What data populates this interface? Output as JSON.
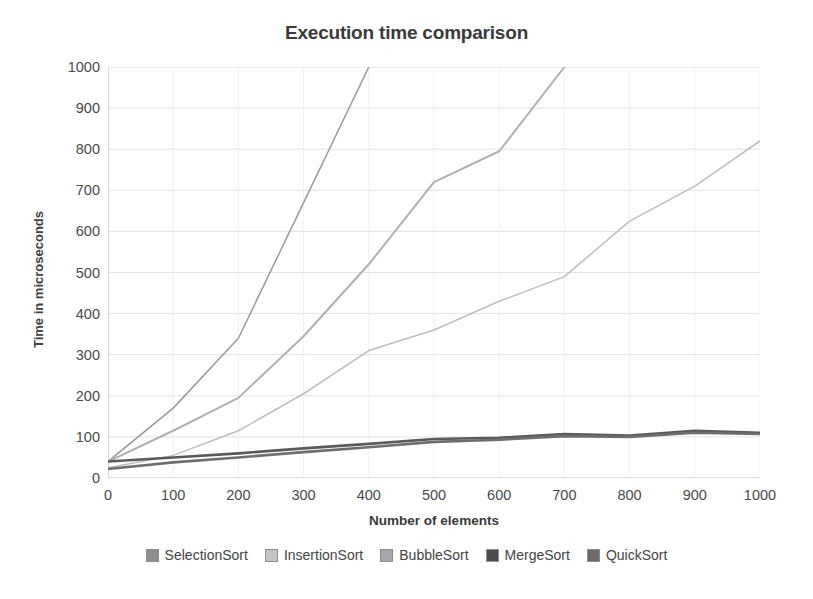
{
  "chart_data": {
    "type": "line",
    "title": "Execution time comparison",
    "xlabel": "Number of elements",
    "ylabel": "Time in microseconds",
    "xlim": [
      0,
      1000
    ],
    "ylim": [
      0,
      1000
    ],
    "xticks": [
      0,
      100,
      200,
      300,
      400,
      500,
      600,
      700,
      800,
      900,
      1000
    ],
    "yticks": [
      0,
      100,
      200,
      300,
      400,
      500,
      600,
      700,
      800,
      900,
      1000
    ],
    "grid": true,
    "grid_axis": "y",
    "legend_position": "bottom",
    "x": [
      0,
      100,
      200,
      300,
      400,
      500,
      600,
      700,
      800,
      900,
      1000
    ],
    "series": [
      {
        "name": "SelectionSort",
        "color": "#9a9a9a",
        "values": [
          40,
          170,
          340,
          670,
          1000,
          null,
          null,
          null,
          null,
          null,
          null
        ],
        "note": "clipped above 1000 after x=400"
      },
      {
        "name": "InsertionSort",
        "color": "#bdbdbd",
        "values": [
          25,
          55,
          115,
          205,
          310,
          360,
          430,
          490,
          625,
          710,
          820
        ]
      },
      {
        "name": "BubbleSort",
        "color": "#b0b0b0",
        "values": [
          40,
          115,
          195,
          345,
          520,
          720,
          795,
          1000,
          null,
          null,
          null
        ],
        "note": "clipped above 1000 after x=700"
      },
      {
        "name": "MergeSort",
        "color": "#5a5a5a",
        "values": [
          40,
          50,
          60,
          72,
          83,
          95,
          98,
          107,
          103,
          115,
          110
        ]
      },
      {
        "name": "QuickSort",
        "color": "#6e6e6e",
        "values": [
          22,
          38,
          50,
          63,
          75,
          88,
          93,
          102,
          100,
          110,
          107
        ]
      }
    ]
  },
  "legend": {
    "items": [
      {
        "label": "SelectionSort",
        "color": "#8d8d8d"
      },
      {
        "label": "InsertionSort",
        "color": "#c4c4c4"
      },
      {
        "label": "BubbleSort",
        "color": "#a8a8a8"
      },
      {
        "label": "MergeSort",
        "color": "#4d4d4d"
      },
      {
        "label": "QuickSort",
        "color": "#6a6a6a"
      }
    ]
  },
  "axes": {
    "y_tick_labels": [
      "1000",
      "900",
      "800",
      "700",
      "600",
      "500",
      "400",
      "300",
      "200",
      "100",
      "0"
    ],
    "x_tick_labels": [
      "0",
      "100",
      "200",
      "300",
      "400",
      "500",
      "600",
      "700",
      "800",
      "900",
      "1000"
    ]
  },
  "colors": {
    "background": "#ffffff",
    "text": "#3c3c3c",
    "gridline": "#e3e3e3",
    "axis": "#c9c9c9"
  }
}
